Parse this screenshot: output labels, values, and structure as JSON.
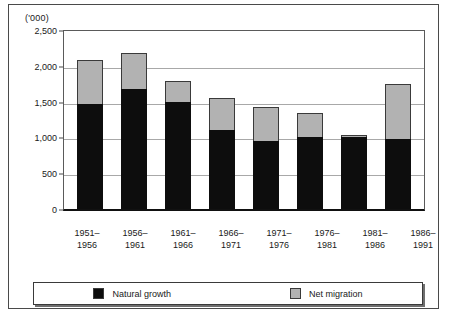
{
  "chart_data": {
    "type": "bar",
    "title": "",
    "subtitle": "",
    "units_label": "('000)",
    "xlabel": "",
    "ylabel": "",
    "ylim": [
      0,
      2500
    ],
    "ytick_values": [
      2500,
      2000,
      1500,
      1000,
      500,
      0
    ],
    "ytick_labels": [
      "2,500",
      "2,000",
      "1,500",
      "1,000",
      "500",
      "0"
    ],
    "grid": true,
    "stacked": true,
    "legend_position": "bottom",
    "categories": [
      "1951–1956",
      "1956–1961",
      "1961–1966",
      "1966–1971",
      "1971–1976",
      "1976–1981",
      "1981–1986",
      "1986–1991"
    ],
    "category_lines": [
      [
        "1951–",
        "1956"
      ],
      [
        "1956–",
        "1961"
      ],
      [
        "1961–",
        "1966"
      ],
      [
        "1966–",
        "1971"
      ],
      [
        "1971–",
        "1976"
      ],
      [
        "1976–",
        "1981"
      ],
      [
        "1981–",
        "1986"
      ],
      [
        "1986–",
        "1991"
      ]
    ],
    "series": [
      {
        "name": "Natural growth",
        "color": "#0d0d0d",
        "values": [
          1470,
          1670,
          1500,
          1100,
          950,
          1000,
          1000,
          980
        ]
      },
      {
        "name": "Net migration",
        "color": "#b2b2b2",
        "values": [
          610,
          505,
          290,
          450,
          480,
          340,
          30,
          770
        ]
      }
    ],
    "totals": [
      2080,
      2175,
      1790,
      1550,
      1430,
      1340,
      1030,
      1750
    ]
  },
  "legend": {
    "items": [
      {
        "label": "Natural growth",
        "swatch": "black"
      },
      {
        "label": "Net migration",
        "swatch": "gray"
      }
    ]
  }
}
